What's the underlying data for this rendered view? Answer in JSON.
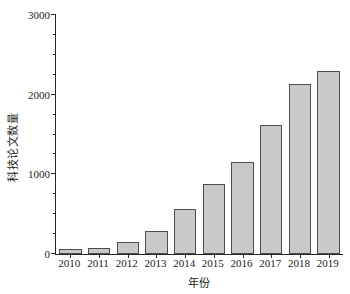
{
  "chart_data": {
    "type": "bar",
    "title": "",
    "xlabel": "年份",
    "ylabel": "科技论文数量",
    "categories": [
      "2010",
      "2011",
      "2012",
      "2013",
      "2014",
      "2015",
      "2016",
      "2017",
      "2018",
      "2019"
    ],
    "values": [
      60,
      80,
      150,
      290,
      560,
      880,
      1150,
      1620,
      2130,
      2300
    ],
    "ylim": [
      0,
      3000
    ],
    "ytick_labels": [
      "0",
      "1000",
      "2000",
      "3000"
    ],
    "ytick_values": [
      0,
      1000,
      2000,
      3000
    ],
    "yminor_step": 250,
    "grid": false,
    "legend": null,
    "bar_fill_color": "#c9c9c9",
    "bar_edge_color": "#4d4d4d",
    "axis_color": "#262626"
  }
}
